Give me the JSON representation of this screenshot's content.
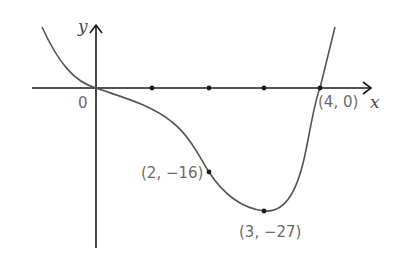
{
  "diagram": {
    "type": "function-graph",
    "function": "y = x^4 - 4x^3",
    "axes": {
      "x_label": "x",
      "y_label": "y",
      "origin_label": "0"
    },
    "x_axis_ticks": [
      1,
      2,
      3
    ],
    "points": [
      {
        "label": "(2, −16)",
        "x": 2,
        "y": -16
      },
      {
        "label": "(3, −27)",
        "x": 3,
        "y": -27
      },
      {
        "label": "(4, 0)",
        "x": 4,
        "y": 0
      }
    ],
    "colors": {
      "axis": "#1a1a1a",
      "curve": "#555555",
      "label": "#6a6a6a"
    }
  }
}
